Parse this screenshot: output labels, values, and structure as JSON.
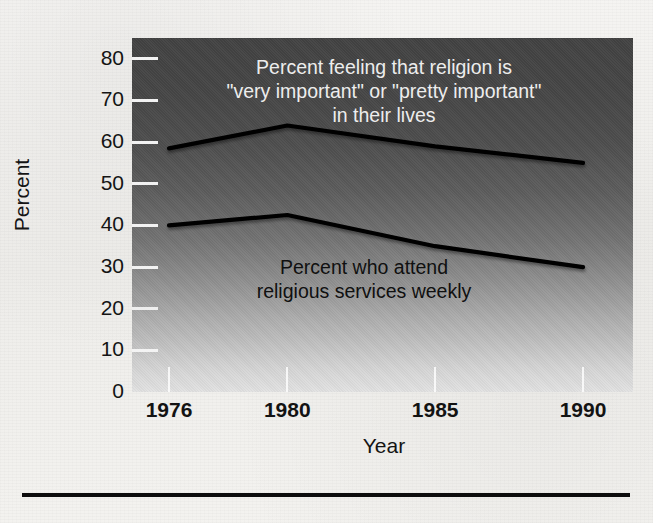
{
  "figure": {
    "kind": "line-chart",
    "background_color": "#f3f2ef",
    "plot_gradient_top": "#424242",
    "plot_gradient_bottom": "#e2e2e2",
    "line_color": "#000000"
  },
  "chart_data": {
    "type": "line",
    "title": "",
    "xlabel": "Year",
    "ylabel": "Percent",
    "x": [
      1976,
      1980,
      1985,
      1990
    ],
    "tick_labels_x": [
      "1976",
      "1980",
      "1985",
      "1990"
    ],
    "tick_labels_y": [
      "0",
      "10",
      "20",
      "30",
      "40",
      "50",
      "60",
      "70",
      "80"
    ],
    "ylim": [
      0,
      85
    ],
    "yticks": [
      0,
      10,
      20,
      30,
      40,
      50,
      60,
      70,
      80
    ],
    "grid": false,
    "legend": "none (inline annotations)",
    "series": [
      {
        "name": "Percent feeling that religion is \"very important\" or \"pretty important\" in their lives",
        "values": [
          58.5,
          64,
          59,
          55
        ]
      },
      {
        "name": "Percent who attend religious services weekly",
        "values": [
          40,
          42.5,
          35,
          30
        ]
      }
    ],
    "annotations": [
      {
        "id": "upper",
        "text": "Percent feeling that religion is\n\"very important\" or \"pretty important\"\nin their lives",
        "color": "#ededed"
      },
      {
        "id": "lower",
        "text": "Percent who attend\nreligious services weekly",
        "color": "#101010"
      }
    ]
  },
  "ghost_text": {
    "a": "",
    "b": "",
    "c": "",
    "d": ""
  }
}
